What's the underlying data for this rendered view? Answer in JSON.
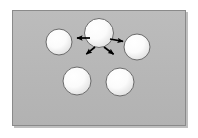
{
  "figure": {
    "canvas": {
      "width": 198,
      "height": 138,
      "background_color": "#ffffff"
    },
    "panel": {
      "name": "gray-background-panel",
      "x": 12,
      "y": 10,
      "width": 174,
      "height": 116,
      "fill_color": "#b6b6b6",
      "border_color": "#8a8a8a",
      "border_width": 1,
      "shadow_color": "#6f6f6f"
    },
    "sphere_style": {
      "fill_center_color": "#ffffff",
      "fill_edge_color": "#e2e2e2",
      "outline_color": "#6b6b6b",
      "outline_width": 1,
      "highlight_color": "#ffffff"
    },
    "spheres": [
      {
        "id": "sphere-center",
        "label": "center sphere",
        "cx": 99,
        "cy": 33,
        "r": 14.5
      },
      {
        "id": "sphere-left",
        "label": "left sphere",
        "cx": 59,
        "cy": 42,
        "r": 13.0
      },
      {
        "id": "sphere-right",
        "label": "right sphere",
        "cx": 137,
        "cy": 47,
        "r": 13.0
      },
      {
        "id": "sphere-bottom-left",
        "label": "bottom left sphere",
        "cx": 77,
        "cy": 81,
        "r": 14.0
      },
      {
        "id": "sphere-bottom-right",
        "label": "bottom right sphere",
        "cx": 120,
        "cy": 82,
        "r": 14.0
      }
    ],
    "arrows": {
      "color": "#000000",
      "count": 4,
      "items": [
        {
          "id": "arrow-left",
          "label": "arrow pointing left",
          "x1": 90,
          "y1": 38,
          "x2": 74,
          "y2": 38
        },
        {
          "id": "arrow-right",
          "label": "arrow pointing right",
          "x1": 110,
          "y1": 39,
          "x2": 126,
          "y2": 42
        },
        {
          "id": "arrow-down-left",
          "label": "arrow pointing down-left",
          "x1": 95,
          "y1": 47,
          "x2": 84,
          "y2": 56
        },
        {
          "id": "arrow-down-right",
          "label": "arrow pointing down-right",
          "x1": 104,
          "y1": 47,
          "x2": 116,
          "y2": 56
        }
      ]
    }
  }
}
